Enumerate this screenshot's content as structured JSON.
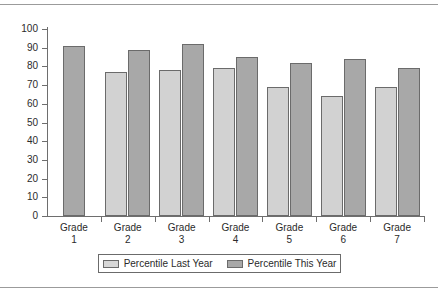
{
  "chart_data": {
    "type": "bar",
    "title": "",
    "subtitle": "",
    "xlabel": "",
    "ylabel": "",
    "ylim": [
      0,
      100
    ],
    "y_ticks": [
      0,
      10,
      20,
      30,
      40,
      50,
      60,
      70,
      80,
      90,
      100
    ],
    "grid": false,
    "legend_position": "bottom",
    "categories": [
      "Grade 1",
      "Grade 2",
      "Grade 3",
      "Grade 4",
      "Grade 5",
      "Grade 6",
      "Grade 7"
    ],
    "category_lines": [
      {
        "line1": "Grade",
        "line2": "1"
      },
      {
        "line1": "Grade",
        "line2": "2"
      },
      {
        "line1": "Grade",
        "line2": "3"
      },
      {
        "line1": "Grade",
        "line2": "4"
      },
      {
        "line1": "Grade",
        "line2": "5"
      },
      {
        "line1": "Grade",
        "line2": "6"
      },
      {
        "line1": "Grade",
        "line2": "7"
      }
    ],
    "series": [
      {
        "name": "Percentile Last Year",
        "color": "#d2d2d2",
        "values": [
          null,
          77,
          78,
          79,
          69,
          64,
          69
        ]
      },
      {
        "name": "Percentile This Year",
        "color": "#a8a8a8",
        "values": [
          91,
          89,
          92,
          85,
          82,
          84,
          79
        ]
      }
    ]
  },
  "legend": {
    "entries": [
      {
        "label": "Percentile Last Year",
        "swatch": "last-year"
      },
      {
        "label": "Percentile This Year",
        "swatch": "this-year"
      }
    ]
  },
  "axis": {
    "y_tick_labels": [
      "100",
      "90",
      "80",
      "70",
      "60",
      "50",
      "40",
      "30",
      "20",
      "10",
      "0"
    ]
  }
}
